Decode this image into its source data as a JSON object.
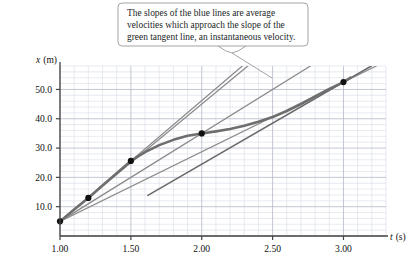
{
  "callout": {
    "lines": [
      "The slopes of the blue lines are average",
      "velocities which approach the slope of the",
      "green tangent line, an instantaneous velocity."
    ]
  },
  "axes": {
    "y_label_symbol": "x",
    "y_label_unit": "(m)",
    "x_label_symbol": "t",
    "x_label_unit": "(s)",
    "x_ticks": [
      "1.00",
      "1.50",
      "2.00",
      "2.50",
      "3.00"
    ],
    "y_ticks": [
      "10.0",
      "20.0",
      "30.0",
      "40.0",
      "50.0"
    ]
  },
  "colors": {
    "curve": "#6e6e6e",
    "secant": "#8a8a8a",
    "tangent": "#6a6a6a",
    "point": "#111111",
    "grid_minor": "#d9dce6",
    "grid_major": "#b9bdcb",
    "axis": "#444444",
    "callout_border": "#9a9a9a",
    "text": "#221f1f"
  },
  "chart_data": {
    "type": "line",
    "title": "",
    "xlabel": "t (s)",
    "ylabel": "x (m)",
    "xlim": [
      1.0,
      3.3
    ],
    "ylim": [
      0.0,
      58.0
    ],
    "grid": true,
    "legend": false,
    "curve": {
      "name": "position x(t)",
      "x": [
        1.0,
        1.1,
        1.2,
        1.3,
        1.4,
        1.5,
        1.6,
        1.7,
        1.8,
        1.9,
        2.0,
        2.1,
        2.2,
        2.3,
        2.4,
        2.5,
        2.6,
        2.7,
        2.8,
        2.9,
        3.0,
        3.05
      ],
      "y": [
        5.0,
        9.0,
        13.0,
        17.2,
        21.4,
        25.6,
        28.6,
        31.0,
        32.8,
        34.2,
        35.0,
        35.7,
        36.5,
        37.6,
        39.0,
        40.6,
        42.6,
        45.0,
        47.6,
        50.2,
        52.5,
        54.0
      ]
    },
    "anchor_point": {
      "x": 1.0,
      "y": 5.0,
      "label": "fixed initial point"
    },
    "data_points": [
      {
        "x": 1.2,
        "y": 13.0
      },
      {
        "x": 1.5,
        "y": 25.6
      },
      {
        "x": 2.0,
        "y": 35.0
      },
      {
        "x": 3.0,
        "y": 52.5
      }
    ],
    "secant_lines": [
      {
        "name": "secant to t=1.20",
        "from": [
          1.0,
          5.0
        ],
        "to": [
          1.2,
          13.0
        ],
        "slope": 40.0
      },
      {
        "name": "secant to t=1.50",
        "from": [
          1.0,
          5.0
        ],
        "to": [
          1.5,
          25.6
        ],
        "slope": 41.2
      },
      {
        "name": "secant to t=2.00",
        "from": [
          1.0,
          5.0
        ],
        "to": [
          2.0,
          35.0
        ],
        "slope": 30.0
      },
      {
        "name": "secant to t=3.00",
        "from": [
          1.0,
          5.0
        ],
        "to": [
          3.0,
          52.5
        ],
        "slope": 23.75
      }
    ],
    "tangent_line": {
      "name": "tangent at t=3.00",
      "touch": [
        3.0,
        52.5
      ],
      "slope": 28.0
    }
  }
}
